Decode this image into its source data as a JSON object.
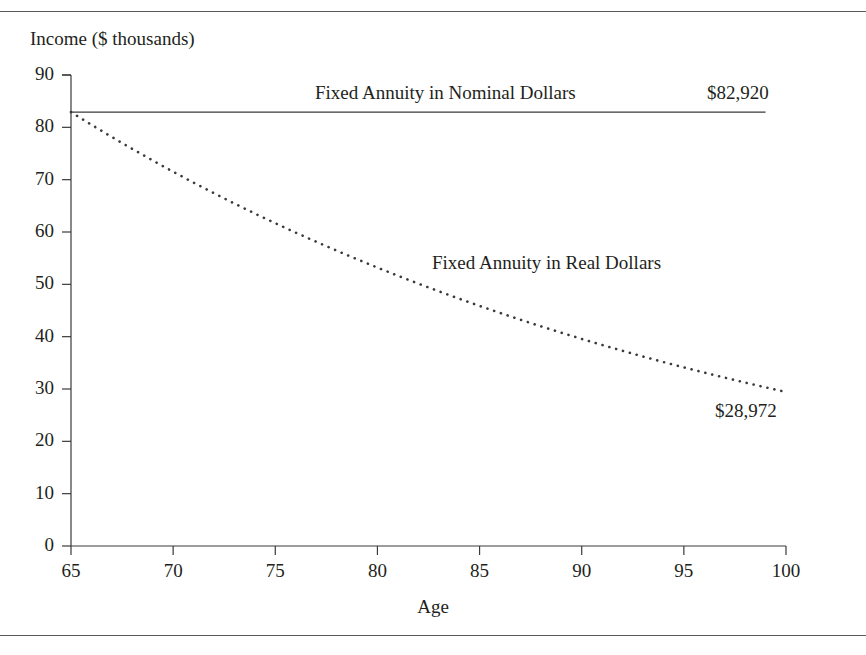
{
  "figure": {
    "background_color": "#ffffff",
    "text_color": "#231f20",
    "rule_color": "#5a5a5a",
    "axis_color": "#3a3a3a"
  },
  "labels": {
    "y_axis_title": "Income ($ thousands)",
    "x_axis_title": "Age",
    "nominal_series": "Fixed Annuity in Nominal Dollars",
    "nominal_value": "$82,920",
    "real_series": "Fixed Annuity in Real Dollars",
    "real_value": "$28,972"
  },
  "chart_data": {
    "type": "line",
    "title": "",
    "subtitle": "",
    "xlabel": "Age",
    "ylabel": "Income ($ thousands)",
    "xlim": [
      65,
      100
    ],
    "ylim": [
      0,
      90
    ],
    "xticks": [
      65,
      70,
      75,
      80,
      85,
      90,
      95,
      100
    ],
    "yticks": [
      0,
      10,
      20,
      30,
      40,
      50,
      60,
      70,
      80,
      90
    ],
    "grid": false,
    "legend": "inline-annotations",
    "annotations": [
      {
        "text": "Fixed Annuity in Nominal Dollars",
        "series": "nominal",
        "x": 81,
        "y": 86
      },
      {
        "text": "$82,920",
        "series": "nominal",
        "x": 99,
        "y": 86
      },
      {
        "text": "Fixed Annuity in Real Dollars",
        "series": "real",
        "x": 87,
        "y": 53
      },
      {
        "text": "$28,972",
        "series": "real",
        "x": 99,
        "y": 23
      }
    ],
    "x": [
      65,
      66,
      67,
      68,
      69,
      70,
      71,
      72,
      73,
      74,
      75,
      76,
      77,
      78,
      79,
      80,
      81,
      82,
      83,
      84,
      85,
      86,
      87,
      88,
      89,
      90,
      91,
      92,
      93,
      94,
      95,
      96,
      97,
      98,
      99,
      100
    ],
    "series": [
      {
        "name": "Fixed Annuity in Nominal Dollars",
        "style": "solid",
        "end_value_label": "$82,920",
        "values": [
          82.92,
          82.92,
          82.92,
          82.92,
          82.92,
          82.92,
          82.92,
          82.92,
          82.92,
          82.92,
          82.92,
          82.92,
          82.92,
          82.92,
          82.92,
          82.92,
          82.92,
          82.92,
          82.92,
          82.92,
          82.92,
          82.92,
          82.92,
          82.92,
          82.92,
          82.92,
          82.92,
          82.92,
          82.92,
          82.92,
          82.92,
          82.92,
          82.92,
          82.92,
          82.92,
          82.92
        ]
      },
      {
        "name": "Fixed Annuity in Real Dollars",
        "style": "dotted",
        "end_value_label": "$28,972",
        "values": [
          82.92,
          80.5,
          78.15,
          75.87,
          73.66,
          71.51,
          69.43,
          67.4,
          65.44,
          63.53,
          61.68,
          59.88,
          58.14,
          56.44,
          54.8,
          53.2,
          51.65,
          50.14,
          48.68,
          47.26,
          45.88,
          44.54,
          43.24,
          41.98,
          40.76,
          39.57,
          38.42,
          37.3,
          36.21,
          35.15,
          34.13,
          33.14,
          32.17,
          31.23,
          30.32,
          29.43
        ]
      }
    ]
  }
}
